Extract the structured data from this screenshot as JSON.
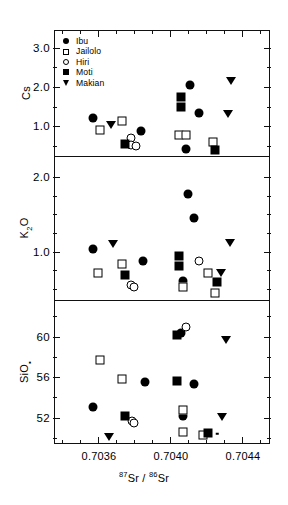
{
  "figure": {
    "background": "#ffffff",
    "ink": "#000000",
    "x_axis": {
      "title_parts": {
        "sup1": "87",
        "el1": "Sr",
        "slash": " / ",
        "sup2": "86",
        "el2": "Sr"
      },
      "title_plain": "87Sr / 86Sr",
      "ticks_major": [
        {
          "label": "0.7036",
          "value": 0.7036
        },
        {
          "label": "0.7040",
          "value": 0.704
        },
        {
          "label": "0.7044",
          "value": 0.7044
        }
      ],
      "minor_step": 0.0001,
      "range": [
        0.70335,
        0.70455
      ]
    },
    "legend": {
      "position": "top-left-inside-panel-1",
      "items": [
        {
          "label": "Ibu",
          "marker": "circle-filled",
          "icon": "filled-circle-icon"
        },
        {
          "label": "Jailolo",
          "marker": "square-open",
          "icon": "open-square-icon"
        },
        {
          "label": "Hiri",
          "marker": "circle-open",
          "icon": "open-circle-icon"
        },
        {
          "label": "Moti",
          "marker": "square-filled",
          "icon": "filled-square-icon"
        },
        {
          "label": "Makian",
          "marker": "triangle-down-filled",
          "icon": "filled-triangle-down-icon"
        }
      ]
    }
  },
  "chart_data": [
    {
      "type": "scatter",
      "panel": 1,
      "title": "",
      "xlabel": "87Sr / 86Sr",
      "ylabel": "Cs",
      "ylabel_plain": "Cs",
      "xlim": [
        0.70335,
        0.70455
      ],
      "ylim": [
        0.25,
        3.45
      ],
      "ytick_labels": [
        "3.0",
        "2.0",
        "1.0"
      ],
      "ytick_values": [
        3.0,
        2.0,
        1.0
      ],
      "yminor_values": [
        3.5,
        2.5,
        1.5,
        0.5
      ],
      "grid": false,
      "legend_position": "upper left",
      "series": [
        {
          "name": "Ibu",
          "marker": "circle-filled",
          "points": [
            [
              0.70356,
              1.24
            ],
            [
              0.70383,
              0.9
            ],
            [
              0.7041,
              2.08
            ],
            [
              0.70415,
              1.36
            ],
            [
              0.70408,
              0.46
            ]
          ]
        },
        {
          "name": "Jailolo",
          "marker": "square-open",
          "points": [
            [
              0.7036,
              0.93
            ],
            [
              0.70372,
              1.16
            ],
            [
              0.70404,
              0.8
            ],
            [
              0.70408,
              0.8
            ],
            [
              0.70423,
              0.62
            ]
          ]
        },
        {
          "name": "Hiri",
          "marker": "circle-open",
          "points": [
            [
              0.70377,
              0.72
            ],
            [
              0.70377,
              0.56
            ],
            [
              0.7038,
              0.54
            ]
          ]
        },
        {
          "name": "Moti",
          "marker": "square-filled",
          "points": [
            [
              0.70374,
              0.58
            ],
            [
              0.70405,
              1.78
            ],
            [
              0.70405,
              1.52
            ],
            [
              0.70424,
              0.42
            ]
          ]
        },
        {
          "name": "Makian",
          "marker": "triangle-down-filled",
          "points": [
            [
              0.70366,
              1.07
            ],
            [
              0.70433,
              2.17
            ],
            [
              0.70431,
              1.34
            ]
          ]
        }
      ]
    },
    {
      "type": "scatter",
      "panel": 2,
      "title": "",
      "xlabel": "87Sr / 86Sr",
      "ylabel": "K2O",
      "ylabel_plain": "K₂O",
      "xlim": [
        0.70335,
        0.70455
      ],
      "ylim": [
        0.35,
        2.28
      ],
      "ytick_labels": [
        "2.0",
        "1.0"
      ],
      "ytick_values": [
        2.0,
        1.0
      ],
      "yminor_values": [
        1.75,
        1.5,
        1.25,
        0.75,
        0.5
      ],
      "grid": false,
      "series": [
        {
          "name": "Ibu",
          "marker": "circle-filled",
          "points": [
            [
              0.70356,
              1.05
            ],
            [
              0.70384,
              0.88
            ],
            [
              0.70409,
              1.79
            ],
            [
              0.70412,
              1.46
            ],
            [
              0.70406,
              0.62
            ]
          ]
        },
        {
          "name": "Jailolo",
          "marker": "square-open",
          "points": [
            [
              0.70359,
              0.73
            ],
            [
              0.70372,
              0.84
            ],
            [
              0.70406,
              0.54
            ],
            [
              0.7042,
              0.72
            ],
            [
              0.70424,
              0.46
            ]
          ]
        },
        {
          "name": "Hiri",
          "marker": "circle-open",
          "points": [
            [
              0.70377,
              0.57
            ],
            [
              0.70379,
              0.54
            ],
            [
              0.70415,
              0.88
            ]
          ]
        },
        {
          "name": "Moti",
          "marker": "square-filled",
          "points": [
            [
              0.70374,
              0.7
            ],
            [
              0.70404,
              0.95
            ],
            [
              0.70404,
              0.82
            ],
            [
              0.70425,
              0.61
            ]
          ]
        },
        {
          "name": "Makian",
          "marker": "triangle-down-filled",
          "points": [
            [
              0.70367,
              1.12
            ],
            [
              0.70432,
              1.13
            ],
            [
              0.70427,
              0.73
            ]
          ]
        }
      ]
    },
    {
      "type": "scatter",
      "panel": 3,
      "title": "",
      "xlabel": "87Sr / 86Sr",
      "ylabel": "SiO2",
      "ylabel_plain": "SiO₄",
      "xlim": [
        0.70335,
        0.70455
      ],
      "ylim": [
        49.4,
        63.6
      ],
      "ytick_labels": [
        "60",
        "56",
        "52"
      ],
      "ytick_values": [
        60,
        56,
        52
      ],
      "yminor_values": [
        62,
        58,
        54,
        50
      ],
      "grid": false,
      "series": [
        {
          "name": "Ibu",
          "marker": "circle-filled",
          "points": [
            [
              0.70356,
              53.1
            ],
            [
              0.70385,
              55.6
            ],
            [
              0.70405,
              60.4
            ],
            [
              0.70412,
              55.4
            ],
            [
              0.70406,
              52.3
            ]
          ]
        },
        {
          "name": "Jailolo",
          "marker": "square-open",
          "points": [
            [
              0.7036,
              57.8
            ],
            [
              0.70372,
              55.9
            ],
            [
              0.70406,
              52.9
            ],
            [
              0.70406,
              50.7
            ],
            [
              0.70417,
              50.4
            ]
          ]
        },
        {
          "name": "Hiri",
          "marker": "circle-open",
          "points": [
            [
              0.70378,
              51.8
            ],
            [
              0.70379,
              51.6
            ],
            [
              0.70408,
              61.0
            ]
          ]
        },
        {
          "name": "Moti",
          "marker": "square-filled",
          "points": [
            [
              0.70374,
              52.3
            ],
            [
              0.70403,
              55.7
            ],
            [
              0.70403,
              60.2
            ],
            [
              0.7042,
              50.6
            ]
          ]
        },
        {
          "name": "Makian",
          "marker": "triangle-down-filled",
          "points": [
            [
              0.70365,
              50.2
            ],
            [
              0.7043,
              59.8
            ],
            [
              0.70428,
              52.2
            ]
          ]
        }
      ],
      "extra_marks": [
        {
          "name": "small-dot",
          "marker": "dot",
          "point": [
            0.70425,
            50.5
          ]
        }
      ]
    }
  ]
}
